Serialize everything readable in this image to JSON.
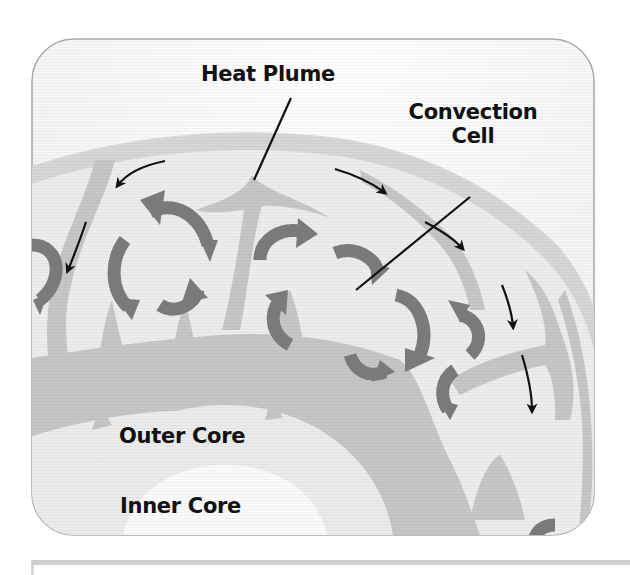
{
  "diagram": {
    "type": "cutaway",
    "labels": {
      "heat_plume": "Heat Plume",
      "convection_cell_line1": "Convection",
      "convection_cell_line2": "Cell",
      "outer_core": "Outer Core",
      "inner_core": "Inner Core"
    },
    "colors": {
      "background": "#ffffff",
      "frame_border": "#a8a8a8",
      "mantle_light": "#ededed",
      "mantle_mid": "#d2d2d2",
      "plume": "#c2c2c2",
      "cell_arrow": "#7a7a7a",
      "crust_arrow": "#111111",
      "outer_core": "#e8e8e8",
      "inner_core": "#fbfbfb",
      "label_text": "#111111"
    }
  }
}
